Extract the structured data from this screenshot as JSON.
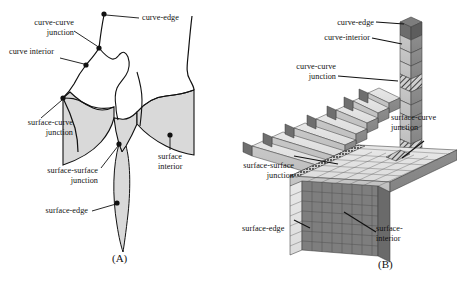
{
  "figure": {
    "background_color": "#ffffff",
    "ink_color": "#111111",
    "surface_fill_color": "#d9d9d9",
    "panels": [
      {
        "id": "A",
        "caption": "(A)",
        "labels": [
          {
            "key": "curve_curve_junction",
            "text": "curve-curve\njunction",
            "name": "label-curve-curve-junction"
          },
          {
            "key": "curve_edge",
            "text": "curve-edge",
            "name": "label-curve-edge"
          },
          {
            "key": "curve_interior",
            "text": "curve interior",
            "name": "label-curve-interior"
          },
          {
            "key": "surface_curve_junction",
            "text": "surface-curve\njunction",
            "name": "label-surface-curve-junction"
          },
          {
            "key": "surface_surface_junction",
            "text": "surface-surface\njunction",
            "name": "label-surface-surface-junction"
          },
          {
            "key": "surface_edge",
            "text": "surface-edge",
            "name": "label-surface-edge"
          },
          {
            "key": "surface_interior",
            "text": "surface\ninterior",
            "name": "label-surface-interior"
          }
        ]
      },
      {
        "id": "B",
        "caption": "(B)",
        "labels": [
          {
            "key": "curve_edge",
            "text": "curve-edge",
            "name": "label-curve-edge"
          },
          {
            "key": "curve_interior",
            "text": "curve-interior",
            "name": "label-curve-interior"
          },
          {
            "key": "curve_curve_junction",
            "text": "curve-curve\njunction",
            "name": "label-curve-curve-junction"
          },
          {
            "key": "surface_curve_junction",
            "text": "surface-curve\njunction",
            "name": "label-surface-curve-junction"
          },
          {
            "key": "surface_surface_junction",
            "text": "surface-surface\njunction",
            "name": "label-surface-surface-junction"
          },
          {
            "key": "surface_edge",
            "text": "surface-edge",
            "name": "label-surface-edge"
          },
          {
            "key": "surface_interior",
            "text": "surface-\ninterior",
            "name": "label-surface-interior"
          }
        ]
      }
    ]
  },
  "panel_a": {
    "caption": "(A)",
    "curve_curve_junction": "curve-curve\njunction",
    "curve_edge": "curve-edge",
    "curve_interior": "curve interior",
    "surface_curve_junction": "surface-curve\njunction",
    "surface_surface_junction": "surface-surface\njunction",
    "surface_edge": "surface-edge",
    "surface_interior": "surface\ninterior"
  },
  "panel_b": {
    "caption": "(B)",
    "curve_edge": "curve-edge",
    "curve_interior": "curve-interior",
    "curve_curve_junction": "curve-curve\njunction",
    "surface_curve_junction": "surface-curve\njunction",
    "surface_surface_junction": "surface-surface\njunction",
    "surface_edge": "surface-edge",
    "surface_interior": "surface-\ninterior"
  }
}
